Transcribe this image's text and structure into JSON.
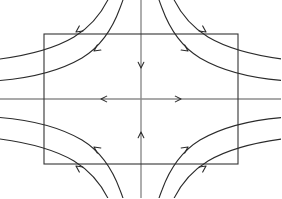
{
  "figure": {
    "name": "saddle-point-phase-portrait",
    "title": "",
    "background_color": "#ffffff",
    "width": 281,
    "height": 198
  },
  "chart_data": {
    "type": "scatter",
    "title": "",
    "subtitle": "",
    "xlabel": "",
    "ylabel": "",
    "grid": false,
    "legend": null,
    "annotations": [],
    "origin": {
      "x": 141,
      "y": 99
    },
    "xlim": [
      -141,
      140
    ],
    "ylim": [
      -99,
      99
    ],
    "viewport_rect": {
      "x": 44,
      "y": 34,
      "width": 194,
      "height": 130
    },
    "styles": {
      "rect_stroke": "#333333",
      "rect_stroke_width": 1.1,
      "axis_stroke": "#8c8c8c",
      "axis_stroke_width": 1.4,
      "curve_stroke": "#2b2b2b",
      "curve_stroke_width": 1.1,
      "arrow_fill": "#2b2b2b"
    },
    "manifolds": [
      {
        "name": "unstable-manifold-horizontal",
        "orientation": "horizontal",
        "color": "#8c8c8c",
        "x1": 0,
        "y1": 99,
        "x2": 281,
        "y2": 99,
        "flow": "outward",
        "arrows": [
          {
            "x": 101,
            "y": 99,
            "angle": 180
          },
          {
            "x": 181,
            "y": 99,
            "angle": 0
          }
        ]
      },
      {
        "name": "stable-manifold-vertical",
        "orientation": "vertical",
        "color": "#8c8c8c",
        "x1": 141,
        "y1": 0,
        "x2": 141,
        "y2": 198,
        "flow": "inward",
        "arrows": [
          {
            "x": 141,
            "y": 68,
            "angle": 90
          },
          {
            "x": 141,
            "y": 132,
            "angle": 270
          }
        ]
      }
    ],
    "trajectories": [
      {
        "name": "q2-inner",
        "quadrant": "upper-left",
        "k": 760,
        "arrow": {
          "t": 0.52,
          "dir": "down-left"
        }
      },
      {
        "name": "q2-outer",
        "quadrant": "upper-left",
        "k": 2250,
        "arrow": {
          "t": 0.52,
          "dir": "down-left"
        }
      },
      {
        "name": "q1-inner",
        "quadrant": "upper-right",
        "k": 760,
        "arrow": {
          "t": 0.52,
          "dir": "down-right"
        }
      },
      {
        "name": "q1-outer",
        "quadrant": "upper-right",
        "k": 2250,
        "arrow": {
          "t": 0.52,
          "dir": "down-right"
        }
      },
      {
        "name": "q3-inner",
        "quadrant": "lower-left",
        "k": 760,
        "arrow": {
          "t": 0.52,
          "dir": "up-left"
        }
      },
      {
        "name": "q3-outer",
        "quadrant": "lower-left",
        "k": 2250,
        "arrow": {
          "t": 0.52,
          "dir": "up-left"
        }
      },
      {
        "name": "q4-inner",
        "quadrant": "lower-right",
        "k": 760,
        "arrow": {
          "t": 0.52,
          "dir": "up-right"
        }
      },
      {
        "name": "q4-outer",
        "quadrant": "lower-right",
        "k": 2250,
        "arrow": {
          "t": 0.52,
          "dir": "up-right"
        }
      }
    ],
    "paths": {
      "q2_inner": "M 0,80.5 C 30,78 58,72 82,58 C 100,47 112,30 120,8 C 123.5,-1 125.5,-7 127,-14",
      "q2_outer": "M 0,59 C 26,55.5 52,50 74,37 C 92,26 105,10 113,-12 C 116,-20 118,-27 119.5,-33",
      "q1_inner": "M 282,80.5 C 252,78 224,72 200,58 C 182,47 170,30 162,8 C 158.5,-1 156.5,-7 155,-14",
      "q1_outer": "M 282,59 C 256,55.5 230,50 208,37 C 190,26 177,10 169,-12 C 166,-20 164,-27 162.5,-33",
      "q3_inner": "M 0,117.5 C 30,120 58,126 82,140 C 100,151 112,168 120,190 C 123.5,199 125.5,205 127,212",
      "q3_outer": "M 0,139 C 26,142.5 52,148 74,161 C 92,172 105,188 113,210 C 116,218 118,225 119.5,231",
      "q4_inner": "M 282,117.5 C 252,120 224,126 200,140 C 182,151 170,168 162,190 C 158.5,199 156.5,205 155,212",
      "q4_outer": "M 282,139 C 256,142.5 230,148 208,161 C 190,172 177,188 169,210 C 166,218 164,225 162.5,231"
    },
    "curve_arrows": [
      {
        "name": "q2-inner-arrow",
        "x": 94,
        "y": 51,
        "angle": 145
      },
      {
        "name": "q2-outer-arrow",
        "x": 76,
        "y": 32,
        "angle": 145
      },
      {
        "name": "q1-inner-arrow",
        "x": 188,
        "y": 51,
        "angle": 35
      },
      {
        "name": "q1-outer-arrow",
        "x": 206,
        "y": 32,
        "angle": 35
      },
      {
        "name": "q3-inner-arrow",
        "x": 94,
        "y": 147,
        "angle": 215
      },
      {
        "name": "q3-outer-arrow",
        "x": 76,
        "y": 166,
        "angle": 215
      },
      {
        "name": "q4-inner-arrow",
        "x": 188,
        "y": 147,
        "angle": 325
      },
      {
        "name": "q4-outer-arrow",
        "x": 206,
        "y": 166,
        "angle": 325
      }
    ]
  }
}
